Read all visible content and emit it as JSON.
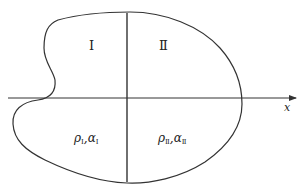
{
  "diagram": {
    "axis": {
      "label": "x",
      "direction": "right"
    },
    "regions": [
      {
        "id": "I",
        "numeral": "Ⅰ",
        "props": {
          "rho": "ρ",
          "rho_sub": "Ⅰ",
          "separator": ",",
          "alpha": "α",
          "alpha_sub": "Ⅰ"
        }
      },
      {
        "id": "II",
        "numeral": "Ⅱ",
        "props": {
          "rho": "ρ",
          "rho_sub": "Ⅱ",
          "separator": ",",
          "alpha": "α",
          "alpha_sub": "Ⅱ"
        }
      }
    ],
    "colors": {
      "stroke": "#333333",
      "background": "#ffffff"
    }
  }
}
